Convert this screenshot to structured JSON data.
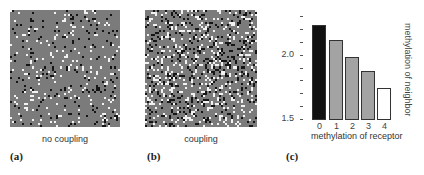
{
  "panels": [
    {
      "id": "a",
      "label": "(a)",
      "caption": "no coupling",
      "lattice": {
        "cols": 55,
        "rows": 58,
        "background": "#7b7b7b",
        "white_density": 0.06,
        "black_density": 0.06,
        "seed": 7
      }
    },
    {
      "id": "b",
      "label": "(b)",
      "caption": "coupling",
      "lattice": {
        "cols": 56,
        "rows": 58,
        "background": "#7b7b7b",
        "white_density": 0.14,
        "black_density": 0.14,
        "seed": 42
      }
    },
    {
      "id": "c",
      "label": "(c)"
    }
  ],
  "chart_data": {
    "type": "bar",
    "title": "",
    "categories": [
      "0",
      "1",
      "2",
      "3",
      "4"
    ],
    "values": [
      2.23,
      2.11,
      1.98,
      1.87,
      1.74
    ],
    "bar_colors": [
      "#111111",
      "#a3a3a3",
      "#a3a3a3",
      "#a3a3a3",
      "#ffffff"
    ],
    "xlabel": "methylation of receptor",
    "ylabel": "methylation of neighbor",
    "ylim": [
      1.5,
      2.3
    ],
    "yticks": [
      1.5,
      1.6,
      1.7,
      1.8,
      1.9,
      2.0,
      2.1,
      2.2,
      2.3
    ],
    "ytick_labels": [
      {
        "value": 2.0,
        "text": "2.0"
      },
      {
        "value": 1.5,
        "text": "1.5"
      }
    ],
    "grid": false,
    "legend": null
  }
}
